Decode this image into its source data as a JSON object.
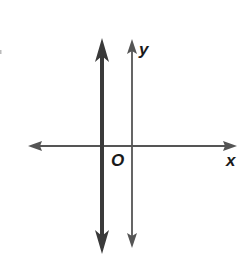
{
  "diagram": {
    "type": "coordinate-plane",
    "axes": {
      "x_label": "x",
      "y_label": "y",
      "origin_label": "O"
    },
    "lines": [
      {
        "name": "x-axis",
        "orientation": "horizontal",
        "style": "thin",
        "arrows": "both"
      },
      {
        "name": "y-axis",
        "orientation": "vertical",
        "style": "thin",
        "arrows": "both"
      },
      {
        "name": "vertical-line",
        "orientation": "vertical",
        "style": "thick",
        "position": "left of y-axis",
        "arrows": "both"
      }
    ],
    "colors": {
      "axis": "#555555",
      "thick_line": "#3a3a3a",
      "label": "#1a1a1a"
    }
  }
}
